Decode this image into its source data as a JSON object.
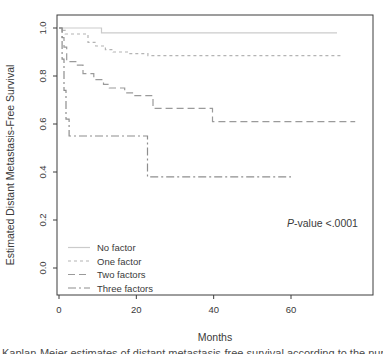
{
  "figure": {
    "caption_cropped": "Kaplan-Meier estimates of distant metastasis-free survival according to the number of fa",
    "background": "#ffffff",
    "axis_color": "#3c3c3c",
    "text_color": "#3a3a3a"
  },
  "chart_data": {
    "type": "line",
    "variant": "kaplan-meier-step-survival",
    "title": "",
    "xlabel": "Months",
    "ylabel": "Estimated Distant Metastasis-Free Survival",
    "xlim": [
      0,
      81
    ],
    "ylim": [
      0,
      1.0
    ],
    "xticks": [
      "0",
      "20",
      "40",
      "60"
    ],
    "xtick_values": [
      0,
      20,
      40,
      60
    ],
    "yticks": [
      "0.0",
      "0.2",
      "0.4",
      "0.6",
      "0.8",
      "1.0"
    ],
    "ytick_values": [
      0.0,
      0.2,
      0.4,
      0.6,
      0.8,
      1.0
    ],
    "grid": false,
    "legend_position": "lower-left",
    "annotation": {
      "italic": "P",
      "text": "-value <.0001"
    },
    "series": [
      {
        "name": "No factor",
        "line_style": "solid",
        "color": "#cbcbcb",
        "steps": [
          [
            0,
            1.0
          ],
          [
            11,
            0.98
          ],
          [
            71.9,
            0.98
          ]
        ]
      },
      {
        "name": "One factor",
        "line_style": "short-dash",
        "color": "#b4b4b4",
        "steps": [
          [
            0,
            1.0
          ],
          [
            0.9,
            0.99
          ],
          [
            1.6,
            0.975
          ],
          [
            7.5,
            0.94
          ],
          [
            9.5,
            0.925
          ],
          [
            12,
            0.91
          ],
          [
            14,
            0.9
          ],
          [
            18,
            0.893
          ],
          [
            23,
            0.885
          ],
          [
            73.2,
            0.885
          ]
        ]
      },
      {
        "name": "Two factors",
        "line_style": "dash",
        "color": "#9a9a9a",
        "steps": [
          [
            0,
            1.0
          ],
          [
            0.8,
            0.96
          ],
          [
            1.3,
            0.92
          ],
          [
            2,
            0.86
          ],
          [
            4.5,
            0.845
          ],
          [
            6.2,
            0.81
          ],
          [
            9,
            0.785
          ],
          [
            11.5,
            0.765
          ],
          [
            13,
            0.75
          ],
          [
            17,
            0.73
          ],
          [
            19,
            0.718
          ],
          [
            24.3,
            0.665
          ],
          [
            39.7,
            0.61
          ],
          [
            76.6,
            0.61
          ]
        ]
      },
      {
        "name": "Three factors",
        "line_style": "dash-dot",
        "color": "#8e8e8e",
        "steps": [
          [
            0,
            1.0
          ],
          [
            0.8,
            0.87
          ],
          [
            1.3,
            0.74
          ],
          [
            1.8,
            0.62
          ],
          [
            2.6,
            0.55
          ],
          [
            22.9,
            0.38
          ],
          [
            60,
            0.38
          ]
        ]
      }
    ]
  }
}
